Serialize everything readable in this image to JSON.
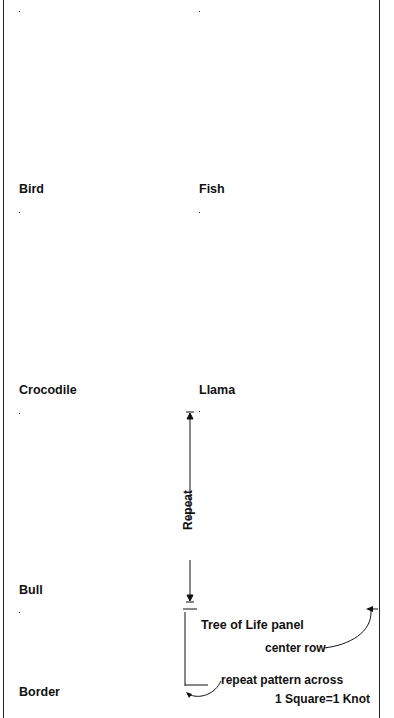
{
  "legend": {
    "scale": "1 Square=1 Knot"
  },
  "colors": {
    "gray": "#8e8e8e",
    "black": "#111111",
    "white": "#fbfbf8",
    "line": "#222222"
  },
  "panels": {
    "bird": {
      "label": "Bird",
      "cols": 14,
      "rows": [
        "..............",
        ".GGGGGG.......",
        "..GGGGG..GGGG.",
        "...GGGGG.GGGGG",
        "....GGGGGGGGG.",
        ".....GGGGGGGG.",
        ".GGGGGGGGGGGG.",
        ".GGGGGGGGGGGG.",
        ".GGGGGGGGGGGG.",
        ".GGG..GGGGGGG.",
        ".GG....GGGGG..",
        ".G.....G.G....",
        ".......G.G....",
        ".......G.G...."
      ]
    },
    "fish": {
      "label": "Fish",
      "cols": 14,
      "rows": [
        "..............",
        ".......GGGGG..",
        "......GGGG....",
        "....GGGGG.....",
        "..GGGGGGGG....",
        ".GGGGGGGGG.GG.",
        ".GGGGGGGGGGG..",
        ".GGGGGGGGGGG..",
        "..GGGGGGGGGG..",
        "...GGG.G.GGG..",
        "....GGG...GG..",
        ".....GGGG.GG..",
        "...........GG.",
        ".............."
      ]
    },
    "crocodile": {
      "label": "Crocodile",
      "cols": 14,
      "rows": [
        "..............",
        "......GGGG....",
        "....GGG.......",
        "..GGGG........",
        ".GG...........",
        ".GGGGG........",
        "..GGGGGGGG....",
        ".....GGGGGGG..",
        ".........GGGG.",
        "........GGGGG.",
        "...GGGGGGGGG..",
        ".GGGGGGGGGGG..",
        "....G......G..",
        ".............."
      ]
    },
    "llama": {
      "label": "Llama",
      "cols": 14,
      "rows": [
        "..............",
        "..........G...",
        "..........GGG.",
        "..........GGG.",
        "..........GG..",
        ".........GGG..",
        "..GGGGGGGGGG..",
        ".GGGGGGGGGGG..",
        "..GGGGGGGGG...",
        "..GGGGGGGGG...",
        "..G.G...G.G...",
        "..G.G...G.G...",
        "..G.G...G.G...",
        "..G.G...G.G..."
      ]
    },
    "bull": {
      "label": "Bull",
      "cols": 14,
      "rows": [
        "..............",
        ".....GGGGGGGG.",
        ".......GGGG...",
        "........GGGG..",
        "........GGGGG.",
        ".........GGGG.",
        "..GGGGGGGGGGG.",
        ".G.GGGGGGGGGG.",
        ".G.GGGGGGGGGG.",
        ".G.GGGGGGGGGG.",
        ".G.G.GGGGGGG..",
        "...G.G...G.G..",
        "...G.G...G.G..",
        "...G.G...G.G.."
      ]
    },
    "tree_of_life": {
      "label": "Tree of Life panel",
      "repeat_label": "Repeat",
      "center_row_label": "center row",
      "cols": 14,
      "symbols": {
        "K": "black-square",
        "X": "cross",
        "/": "diagonal-slash",
        "O": "circle",
        ".": "empty"
      },
      "rows": [
        "K.....KK.....K",
        ".K...K..K...K.",
        "...X......X...",
        "X.XXX.XX.XXX.X",
        ".X.X.X..X.X.X.",
        ".X.X.X..X.X.X.",
        ".XXXXX..XXXXX.",
        "../// ...///..",
        ".../......./..",
        ".././...../../",
        "./.../../.../.",
        "/.....//...../",
        "...O......O...",
        "..OOO....OOO..",
        ".OO.OO..OO.OO.",
        "...K......K...",
        "K.KKK.KK.KKK.K"
      ]
    },
    "border": {
      "label": "Border",
      "repeat_label": "repeat pattern across",
      "cols": 14,
      "rows": [
        "G..G..G..G..G.",
        ".G..G..G..G..G",
        "..G..G..G..G..",
        "G..G..G..G..G.",
        ".G..G..G..G..G",
        "..G..G..G..G.."
      ]
    }
  }
}
